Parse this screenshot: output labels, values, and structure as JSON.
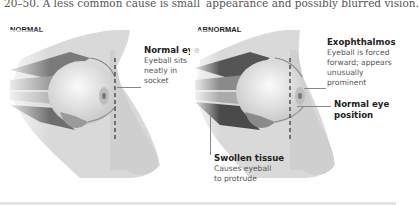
{
  "text": {
    "left_fragment": "20–50. A less common cause is small",
    "right_fragment": "appearance and possibly blurred vision."
  },
  "panels": [
    {
      "label": "NORMAL",
      "callouts": [
        {
          "title": "Normal eye",
          "desc_lines": [
            "Eyeball sits",
            "neatly in",
            "socket"
          ]
        }
      ]
    },
    {
      "label": "ABNORMAL",
      "callouts": [
        {
          "title": "Exophthalmos",
          "desc_lines": [
            "Eyeball is forced",
            "forward; appears",
            "unusually",
            "prominent"
          ]
        },
        {
          "title_lines": [
            "Normal eye",
            "position"
          ]
        },
        {
          "title": "Swollen tissue",
          "desc_lines": [
            "Causes eyeball",
            "to protrude"
          ]
        }
      ]
    }
  ],
  "colors": {
    "skin": "#dcdcdc",
    "eyeball": "#f2f2f2",
    "muscle_dark": "#6e6e6e",
    "dashed_line": "#333333"
  }
}
